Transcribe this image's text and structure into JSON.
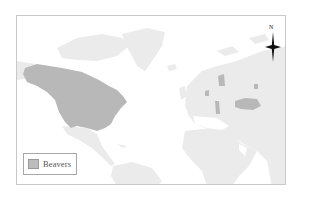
{
  "map": {
    "type": "world-distribution-map",
    "subject": "Beavers",
    "colors": {
      "ocean": "#ffffff",
      "land": "#ebebeb",
      "highlight": "#b8b8b8",
      "frame": "#c9c9c9"
    },
    "highlighted_regions": [
      "North America (Canada, United States)",
      "Scandinavia",
      "Western Russia / Central Russia patches",
      "Eastern Europe patch"
    ]
  },
  "legend": {
    "items": [
      {
        "label": "Beavers",
        "swatch_color": "#bdbdbd"
      }
    ]
  },
  "compass": {
    "label": "N"
  }
}
